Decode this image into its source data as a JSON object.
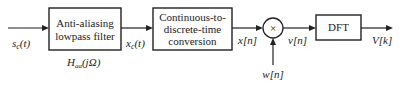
{
  "diagram": {
    "type": "block-diagram",
    "blocks": [
      {
        "id": "aa-filter",
        "lines": [
          "Anti-aliasing",
          "lowpass filter"
        ],
        "sublabel": "H_aa(jΩ)"
      },
      {
        "id": "c2d",
        "lines": [
          "Continuous-to-",
          "discrete-time",
          "conversion"
        ]
      },
      {
        "id": "multiplier",
        "symbol": "×"
      },
      {
        "id": "dft",
        "lines": [
          "DFT"
        ]
      }
    ],
    "signals": {
      "input": "s_c(t)",
      "after_filter": "x_c(t)",
      "after_c2d": "x[n]",
      "window": "w[n]",
      "after_mult": "v[n]",
      "output": "V[k]"
    }
  },
  "text": {
    "aa_line1": "Anti-aliasing",
    "aa_line2": "lowpass filter",
    "aa_sub_H": "H",
    "aa_sub_idx": "aa",
    "aa_sub_arg": "(jΩ)",
    "c2d_line1": "Continuous-to-",
    "c2d_line2": "discrete-time",
    "c2d_line3": "conversion",
    "mult_symbol": "×",
    "dft_label": "DFT",
    "sig_s": "s",
    "sig_s_sub": "c",
    "sig_s_arg": "(t)",
    "sig_x": "x",
    "sig_x_sub": "c",
    "sig_x_arg": "(t)",
    "sig_xn": "x[n]",
    "sig_wn": "w[n]",
    "sig_vn": "v[n]",
    "sig_Vk": "V[k]"
  }
}
